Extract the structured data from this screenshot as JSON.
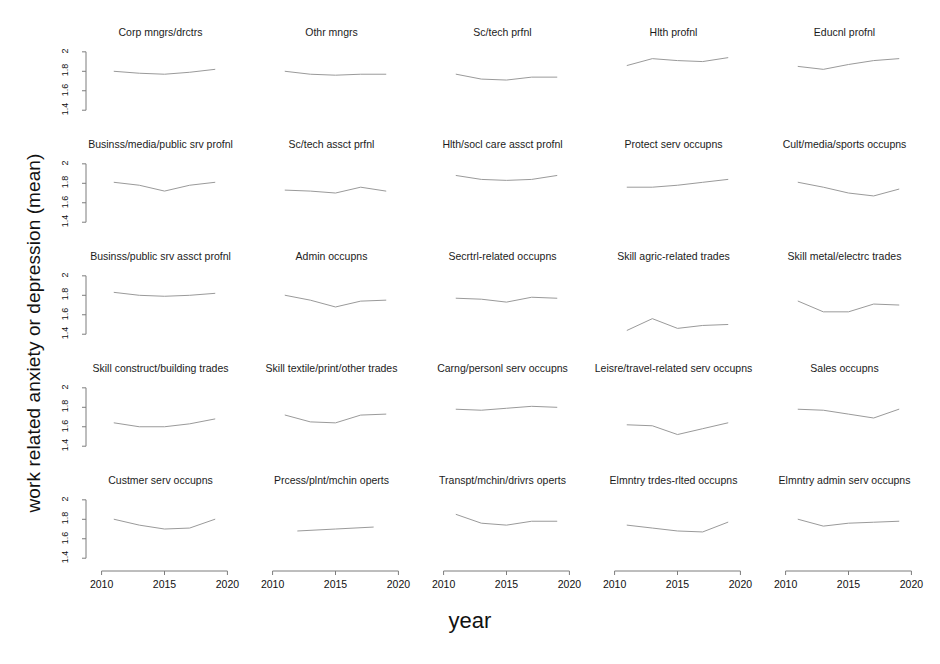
{
  "chart_data": {
    "type": "line",
    "title": "",
    "xlabel": "year",
    "ylabel": "work related anxiety or depression (mean)",
    "xlim": [
      2009,
      2021
    ],
    "ylim": [
      1.32,
      2.06
    ],
    "xticks": [
      2010,
      2015,
      2020
    ],
    "xticklabels": [
      "2010",
      "2015",
      "2020"
    ],
    "yticks": [
      1.4,
      1.6,
      1.8,
      2.0
    ],
    "yticklabels": [
      "1.4",
      "1.6",
      "1.8",
      "2"
    ],
    "grid": false,
    "legend": "none",
    "layout": "5x5 small multiples (faceted panels)",
    "line_color": "#9a9a9a",
    "axis_color": "#7d7d7d",
    "panels": [
      {
        "title": "Corp mngrs/drctrs",
        "x": [
          2011,
          2013,
          2015,
          2017,
          2019
        ],
        "y": [
          1.8,
          1.78,
          1.77,
          1.79,
          1.82
        ]
      },
      {
        "title": "Othr mngrs",
        "x": [
          2011,
          2013,
          2015,
          2017,
          2019
        ],
        "y": [
          1.8,
          1.77,
          1.76,
          1.77,
          1.77
        ]
      },
      {
        "title": "Sc/tech prfnl",
        "x": [
          2011,
          2013,
          2015,
          2017,
          2019
        ],
        "y": [
          1.77,
          1.72,
          1.71,
          1.74,
          1.74
        ]
      },
      {
        "title": "Hlth profnl",
        "x": [
          2011,
          2013,
          2015,
          2017,
          2019
        ],
        "y": [
          1.86,
          1.93,
          1.91,
          1.9,
          1.94
        ]
      },
      {
        "title": "Educnl profnl",
        "x": [
          2011,
          2013,
          2015,
          2017,
          2019
        ],
        "y": [
          1.85,
          1.82,
          1.87,
          1.91,
          1.93
        ]
      },
      {
        "title": "Businss/media/public srv profnl",
        "x": [
          2011,
          2013,
          2015,
          2017,
          2019
        ],
        "y": [
          1.81,
          1.78,
          1.72,
          1.78,
          1.81
        ]
      },
      {
        "title": "Sc/tech assct prfnl",
        "x": [
          2011,
          2013,
          2015,
          2017,
          2019
        ],
        "y": [
          1.73,
          1.72,
          1.7,
          1.76,
          1.72
        ]
      },
      {
        "title": "Hlth/socl care assct profnl",
        "x": [
          2011,
          2013,
          2015,
          2017,
          2019
        ],
        "y": [
          1.88,
          1.84,
          1.83,
          1.84,
          1.88
        ]
      },
      {
        "title": "Protect serv occupns",
        "x": [
          2011,
          2013,
          2015,
          2017,
          2019
        ],
        "y": [
          1.76,
          1.76,
          1.78,
          1.81,
          1.84
        ]
      },
      {
        "title": "Cult/media/sports occupns",
        "x": [
          2011,
          2013,
          2015,
          2017,
          2019
        ],
        "y": [
          1.81,
          1.76,
          1.7,
          1.67,
          1.74
        ]
      },
      {
        "title": "Businss/public srv assct profnl",
        "x": [
          2011,
          2013,
          2015,
          2017,
          2019
        ],
        "y": [
          1.83,
          1.8,
          1.79,
          1.8,
          1.82
        ]
      },
      {
        "title": "Admin occupns",
        "x": [
          2011,
          2013,
          2015,
          2017,
          2019
        ],
        "y": [
          1.8,
          1.75,
          1.68,
          1.74,
          1.75
        ]
      },
      {
        "title": "Secrtrl-related occupns",
        "x": [
          2011,
          2013,
          2015,
          2017,
          2019
        ],
        "y": [
          1.77,
          1.76,
          1.73,
          1.78,
          1.77
        ]
      },
      {
        "title": "Skill agric-related trades",
        "x": [
          2011,
          2013,
          2015,
          2017,
          2019
        ],
        "y": [
          1.44,
          1.56,
          1.46,
          1.49,
          1.5
        ]
      },
      {
        "title": "Skill metal/electrc trades",
        "x": [
          2011,
          2013,
          2015,
          2017,
          2019
        ],
        "y": [
          1.74,
          1.63,
          1.63,
          1.71,
          1.7
        ]
      },
      {
        "title": "Skill construct/building trades",
        "x": [
          2011,
          2013,
          2015,
          2017,
          2019
        ],
        "y": [
          1.64,
          1.6,
          1.6,
          1.63,
          1.68
        ]
      },
      {
        "title": "Skill textile/print/other trades",
        "x": [
          2011,
          2013,
          2015,
          2017,
          2019
        ],
        "y": [
          1.72,
          1.65,
          1.64,
          1.72,
          1.73
        ]
      },
      {
        "title": "Carng/personl serv occupns",
        "x": [
          2011,
          2013,
          2015,
          2017,
          2019
        ],
        "y": [
          1.78,
          1.77,
          1.79,
          1.81,
          1.8
        ]
      },
      {
        "title": "Leisre/travel-related serv occupns",
        "x": [
          2011,
          2013,
          2015,
          2017,
          2019
        ],
        "y": [
          1.62,
          1.61,
          1.52,
          1.58,
          1.64
        ]
      },
      {
        "title": "Sales occupns",
        "x": [
          2011,
          2013,
          2015,
          2017,
          2019
        ],
        "y": [
          1.78,
          1.77,
          1.73,
          1.69,
          1.78
        ]
      },
      {
        "title": "Custmer serv occupns",
        "x": [
          2011,
          2013,
          2015,
          2017,
          2019
        ],
        "y": [
          1.8,
          1.74,
          1.7,
          1.71,
          1.8
        ]
      },
      {
        "title": "Prcess/plnt/mchin operts",
        "x": [
          2012,
          2015,
          2018
        ],
        "y": [
          1.68,
          1.7,
          1.72
        ]
      },
      {
        "title": "Transpt/mchin/drivrs operts",
        "x": [
          2011,
          2013,
          2015,
          2017,
          2019
        ],
        "y": [
          1.85,
          1.76,
          1.74,
          1.78,
          1.78
        ]
      },
      {
        "title": "Elmntry trdes-rlted occupns",
        "x": [
          2011,
          2013,
          2015,
          2017,
          2019
        ],
        "y": [
          1.74,
          1.71,
          1.68,
          1.67,
          1.77
        ]
      },
      {
        "title": "Elmntry admin serv occupns",
        "x": [
          2011,
          2013,
          2015,
          2017,
          2019
        ],
        "y": [
          1.8,
          1.73,
          1.76,
          1.77,
          1.78
        ]
      }
    ]
  }
}
